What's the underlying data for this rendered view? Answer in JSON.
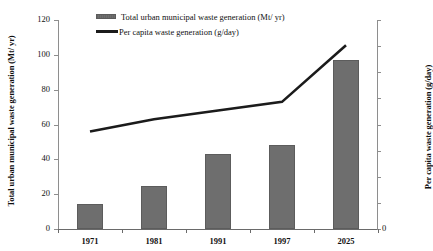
{
  "chart_data": {
    "type": "bar",
    "title": "",
    "subtitle": "",
    "xlabel": "",
    "ylabel": "Total urban municipal waste generation (Mt/ yr)",
    "y2label": "Per capita waste generation (g/day)",
    "categories": [
      "1971",
      "1981",
      "1991",
      "1997",
      "2025"
    ],
    "series": [
      {
        "name": "Total urban municipal waste generation (Mt/ yr)",
        "type": "bar",
        "axis": "left",
        "color": "#6e6e6e",
        "values": [
          14.5,
          24.5,
          43,
          48,
          97
        ]
      },
      {
        "name": "Per capita waste generation (g/day)",
        "type": "line",
        "axis": "right",
        "color": "#1b1b1b",
        "values": [
          56,
          63,
          68,
          73,
          105.5
        ]
      }
    ],
    "ylim": [
      0,
      120
    ],
    "yticks": [
      0,
      20,
      40,
      60,
      80,
      100,
      120
    ],
    "ytick_labels": [
      "0",
      "20",
      "40",
      "60",
      "80",
      "100",
      "120"
    ],
    "y2lim": [
      0,
      120
    ],
    "y2ticks": [
      0,
      15,
      30,
      45,
      60,
      75,
      90,
      105,
      120
    ],
    "y2tick_labels": [
      "0",
      "",
      "",
      "",
      "",
      "",
      "",
      "",
      ""
    ],
    "grid": false,
    "legend_position": "top-center",
    "legend": [
      {
        "label": "Total urban municipal waste generation (Mt/ yr)",
        "marker": "bar-swatch"
      },
      {
        "label": "Per capita waste generation (g/day)",
        "marker": "line-swatch"
      }
    ]
  },
  "axes": {
    "left_title": "Total urban municipal waste generation (Mt/ yr)",
    "right_title": "Per capita waste generation (g/day)"
  }
}
